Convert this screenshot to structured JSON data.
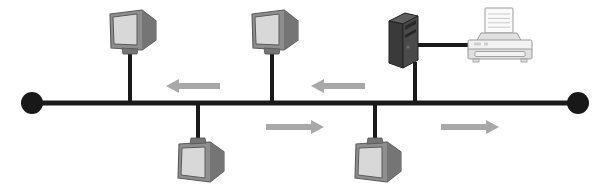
{
  "diagram": {
    "title": "Bus network topology with shared printer",
    "canvas": {
      "width": 610,
      "height": 191,
      "background": "#ffffff"
    },
    "colors": {
      "bus_line": "#1a1a1a",
      "terminator": "#181818",
      "drop_line": "#1a1a1a",
      "monitor_body": "#8e8e8e",
      "monitor_body_dark": "#757575",
      "monitor_screen": "#d8d8d8",
      "monitor_outline": "#5a5a5a",
      "tower_front": "#4a4a4a",
      "tower_side": "#3a3a3a",
      "tower_top": "#5e5e5e",
      "tower_outline": "#222222",
      "printer_body": "#f2f2f2",
      "printer_shade": "#e0e0e0",
      "printer_outline": "#9a9a9a",
      "printer_paper": "#fafafa",
      "arrow": "#a8a8a8",
      "cable": "#1a1a1a"
    },
    "bus": {
      "label": "network-bus-backbone",
      "y": 103,
      "x_start": 32,
      "x_end": 578,
      "thickness": 5
    },
    "terminators": [
      {
        "name": "left-terminator",
        "label": "Terminator",
        "cx": 32,
        "cy": 103,
        "r": 11
      },
      {
        "name": "right-terminator",
        "label": "Terminator",
        "cx": 578,
        "cy": 103,
        "r": 11
      }
    ],
    "nodes": [
      {
        "id": "workstation-1",
        "type": "monitor",
        "label": "Workstation",
        "orientation": "top",
        "facing": "left",
        "drop_x": 130,
        "drop_y_from": 103,
        "drop_y_to": 50,
        "icon_x": 104,
        "icon_y": 9
      },
      {
        "id": "workstation-2",
        "type": "monitor",
        "label": "Workstation",
        "orientation": "top",
        "facing": "left",
        "drop_x": 272,
        "drop_y_from": 103,
        "drop_y_to": 50,
        "icon_x": 246,
        "icon_y": 9
      },
      {
        "id": "workstation-3",
        "type": "monitor",
        "label": "Workstation",
        "orientation": "bottom",
        "facing": "left",
        "drop_x": 198,
        "drop_y_from": 103,
        "drop_y_to": 143,
        "icon_x": 172,
        "icon_y": 137
      },
      {
        "id": "workstation-4",
        "type": "monitor",
        "label": "Workstation",
        "orientation": "bottom",
        "facing": "left",
        "drop_x": 375,
        "drop_y_from": 103,
        "drop_y_to": 143,
        "icon_x": 349,
        "icon_y": 137
      },
      {
        "id": "print-server",
        "type": "tower-pc",
        "label": "Print server",
        "orientation": "top",
        "drop_x": 415,
        "drop_y_from": 103,
        "drop_y_to": 62,
        "icon_x": 387,
        "icon_y": 11
      },
      {
        "id": "network-printer",
        "type": "printer",
        "label": "Printer",
        "icon_x": 466,
        "icon_y": 8
      }
    ],
    "peripheral_cable": {
      "name": "printer-cable",
      "label": "Printer cable",
      "x_start": 414,
      "x_end": 492,
      "y": 45,
      "thickness": 4
    },
    "arrows": [
      {
        "id": "signal-left-1",
        "label": "Signal direction left",
        "direction": "left",
        "x": 166,
        "y": 86,
        "length": 54
      },
      {
        "id": "signal-left-2",
        "label": "Signal direction left",
        "direction": "left",
        "x": 311,
        "y": 86,
        "length": 54
      },
      {
        "id": "signal-right-1",
        "label": "Signal direction right",
        "direction": "right",
        "x": 266,
        "y": 127,
        "length": 58
      },
      {
        "id": "signal-right-2",
        "label": "Signal direction right",
        "direction": "right",
        "x": 441,
        "y": 127,
        "length": 58
      }
    ]
  }
}
